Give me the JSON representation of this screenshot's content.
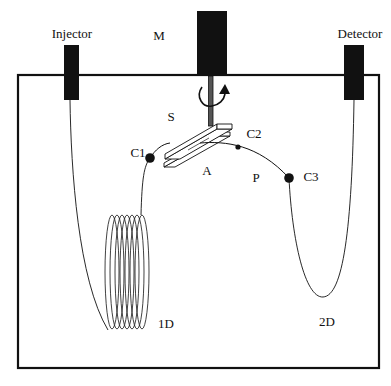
{
  "diagram": {
    "type": "schematic",
    "labels": {
      "injector": "Injector",
      "motor": "M",
      "detector": "Detector",
      "switch": "S",
      "connector1": "C1",
      "connector2": "C2",
      "connector3": "C3",
      "junction_a": "A",
      "junction_p": "P",
      "first_dimension": "1D",
      "second_dimension": "2D"
    },
    "colors": {
      "stroke": "#111111",
      "fill_block": "#111111",
      "background": "#ffffff"
    }
  },
  "caption": {
    "text": ""
  }
}
